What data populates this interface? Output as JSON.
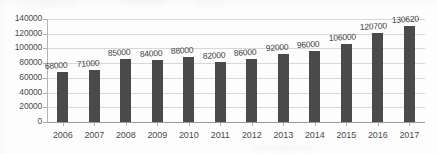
{
  "chart_data": {
    "type": "bar",
    "title": "",
    "subtitle": "",
    "xlabel": "",
    "ylabel": "",
    "categories": [
      "2006",
      "2007",
      "2008",
      "2009",
      "2010",
      "2011",
      "2012",
      "2013",
      "2014",
      "2015",
      "2016",
      "2017"
    ],
    "values": [
      68000,
      71000,
      85000,
      84000,
      88000,
      82000,
      86000,
      92000,
      96000,
      106000,
      120700,
      130620
    ],
    "data_labels": [
      "68000",
      "71000",
      "85000",
      "84000",
      "88000",
      "82000",
      "86000",
      "92000",
      "96000",
      "106000",
      "120700",
      "130620"
    ],
    "ylim": [
      0,
      140000
    ],
    "ytick_values": [
      140000,
      120000,
      100000,
      80000,
      60000,
      40000,
      20000,
      0
    ],
    "ytick_labels": [
      "140000",
      "120000",
      "100000",
      "80000",
      "60000",
      "40000",
      "20000",
      "0"
    ],
    "grid": true,
    "grid_axis": "y",
    "legend": false,
    "legend_position": "none",
    "series": [
      {
        "name": "",
        "values": [
          68000,
          71000,
          85000,
          84000,
          88000,
          82000,
          86000,
          92000,
          96000,
          106000,
          120700,
          130620
        ]
      }
    ],
    "colors": {
      "bar": "#4a4a4a",
      "gridline": "#d8d8d8",
      "axis": "#9a9a9a",
      "text": "#4c4c4c",
      "background": "#fdfdfd"
    }
  }
}
